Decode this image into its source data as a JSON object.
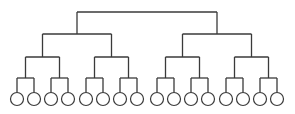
{
  "diagram": {
    "type": "binary-tree",
    "depth": 4,
    "leaf_count": 16,
    "colors": {
      "line": "#3a3a3a",
      "background": "#ffffff",
      "leaf_fill": "#ffffff"
    },
    "levels_y": [
      12,
      34,
      57,
      78
    ],
    "leaf_y": 99,
    "leaf_radius": 6.5,
    "leaves_x": [
      17,
      34,
      51,
      68,
      86,
      103,
      120,
      137,
      157,
      174,
      191,
      208,
      226,
      243,
      260,
      277
    ]
  }
}
